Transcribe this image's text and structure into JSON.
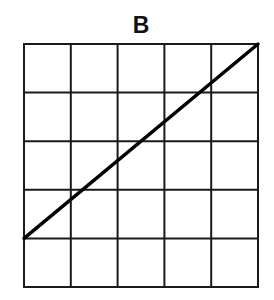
{
  "diagram": {
    "label": "B",
    "grid": {
      "columns": 5,
      "rows": 5,
      "left": 24,
      "top": 44,
      "right": 258,
      "bottom": 287,
      "line_color": "#1a1a1a",
      "line_width": 2
    },
    "line": {
      "description": "straight line from left edge at top of bottom row to top-right corner",
      "start_cell": {
        "col": 0,
        "row": 4
      },
      "end_cell": {
        "col": 5,
        "row": 0
      },
      "color": "#000000",
      "width": 3.5
    }
  }
}
